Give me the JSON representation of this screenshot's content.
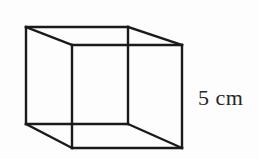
{
  "figure": {
    "type": "geometry-diagram",
    "background_color": "#fdfdfd",
    "stroke_color": "#1a1a1a",
    "text_color": "#262626",
    "label": {
      "text": "5 cm",
      "value": "5",
      "unit": "cm",
      "describes": "edge-length"
    },
    "geometry": {
      "back_face": {
        "top_left": [
          26,
          27
        ],
        "top_right": [
          128,
          27
        ],
        "bottom_right": [
          128,
          124
        ],
        "bottom_left": [
          26,
          124
        ]
      },
      "front_face": {
        "top_left": [
          72,
          45
        ],
        "top_right": [
          182,
          45
        ],
        "bottom_right": [
          182,
          148
        ],
        "bottom_left": [
          72,
          148
        ]
      },
      "connectors": [
        [
          [
            26,
            27
          ],
          [
            72,
            45
          ]
        ],
        [
          [
            128,
            27
          ],
          [
            182,
            45
          ]
        ],
        [
          [
            128,
            124
          ],
          [
            182,
            148
          ]
        ],
        [
          [
            26,
            124
          ],
          [
            72,
            148
          ]
        ]
      ]
    }
  }
}
